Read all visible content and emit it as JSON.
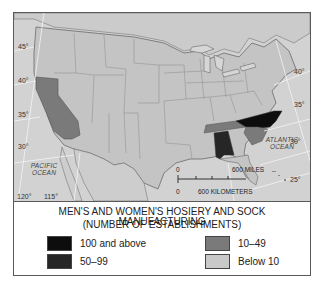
{
  "map": {
    "latitude_labels_left": [
      "45°",
      "40°",
      "35°",
      "30°"
    ],
    "latitude_labels_right": [
      "40°",
      "35°",
      "30°",
      "25°"
    ],
    "longitude_labels": [
      "120°",
      "115°"
    ],
    "oceans": {
      "pacific": "PACIFIC\nOCEAN",
      "atlantic": "ATLANTIC\nOCEAN"
    },
    "scale": {
      "zero_top": "0",
      "miles": "600 MILES",
      "zero_bottom": "0",
      "kilometers": "600 KILOMETERS"
    },
    "colors": {
      "base": "#c9c9c9",
      "border": "#8a8a8a",
      "class_100_above": "#0d0d0d",
      "class_50_99": "#262626",
      "class_10_49": "#7a7a7a",
      "class_below_10": "#c9c9c9"
    },
    "highlighted_states": [
      {
        "state": "California",
        "class": "10–49"
      },
      {
        "state": "Tennessee",
        "class": "10–49"
      },
      {
        "state": "Alabama",
        "class": "50–99"
      },
      {
        "state": "North Carolina",
        "class": "100 and above"
      },
      {
        "state": "South Carolina",
        "class": "10–49"
      }
    ]
  },
  "legend": {
    "title_line1": "MEN'S AND WOMEN'S HOSIERY AND SOCK MANUFACTURING",
    "title_line2": "(NUMBER OF ESTABLISHMENTS)",
    "items": [
      {
        "label": "100 and above",
        "color": "#0d0d0d"
      },
      {
        "label": "50–99",
        "color": "#262626"
      },
      {
        "label": "10–49",
        "color": "#7a7a7a"
      },
      {
        "label": "Below 10",
        "color": "#c9c9c9"
      }
    ]
  }
}
